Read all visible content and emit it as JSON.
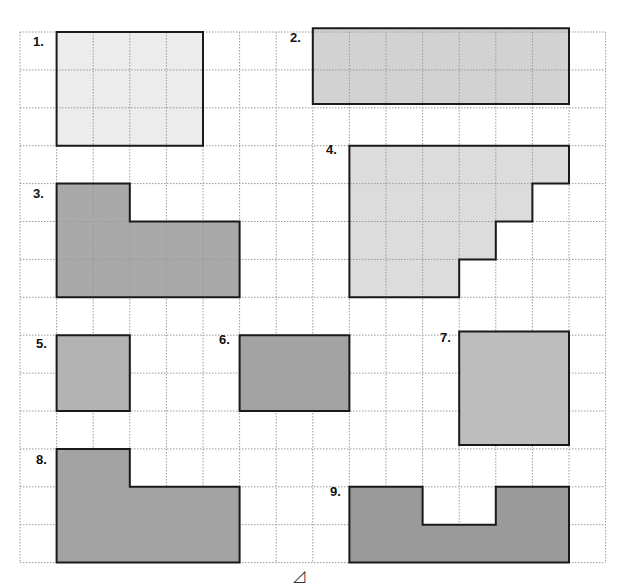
{
  "worksheet": {
    "grid": {
      "origin_x": 20,
      "origin_y": 32,
      "cell_w": 36.6,
      "cell_h": 37.9,
      "cols": 16,
      "rows": 14,
      "line_color": "#9a9a9a",
      "line_style": "dotted"
    },
    "shapes": [
      {
        "label": "1.",
        "fill": "#ececec",
        "inner_grid": true,
        "cells": [
          [
            1,
            0
          ],
          [
            2,
            0
          ],
          [
            3,
            0
          ],
          [
            4,
            0
          ],
          [
            1,
            1
          ],
          [
            2,
            1
          ],
          [
            3,
            1
          ],
          [
            4,
            1
          ],
          [
            1,
            2
          ],
          [
            2,
            2
          ],
          [
            3,
            2
          ],
          [
            4,
            2
          ]
        ],
        "outline": [
          [
            1,
            0
          ],
          [
            5,
            0
          ],
          [
            5,
            3
          ],
          [
            1,
            3
          ]
        ],
        "label_pos": [
          33,
          34
        ]
      },
      {
        "label": "2.",
        "fill": "#d2d2d2",
        "inner_grid": true,
        "cells": [
          [
            8,
            0
          ],
          [
            9,
            0
          ],
          [
            10,
            0
          ],
          [
            11,
            0
          ],
          [
            12,
            0
          ],
          [
            13,
            0
          ],
          [
            14,
            0
          ],
          [
            8,
            1
          ],
          [
            9,
            1
          ],
          [
            10,
            1
          ],
          [
            11,
            1
          ],
          [
            12,
            1
          ],
          [
            13,
            1
          ],
          [
            14,
            1
          ]
        ],
        "outline": [
          [
            8,
            -0.1
          ],
          [
            15,
            -0.1
          ],
          [
            15,
            1.9
          ],
          [
            8,
            1.9
          ]
        ],
        "label_pos": [
          290,
          30
        ]
      },
      {
        "label": "3.",
        "fill": "#a9a9a9",
        "inner_grid": true,
        "cells": [
          [
            1,
            4
          ],
          [
            2,
            4
          ],
          [
            1,
            5
          ],
          [
            2,
            5
          ],
          [
            3,
            5
          ],
          [
            4,
            5
          ],
          [
            5,
            5
          ],
          [
            1,
            6
          ],
          [
            2,
            6
          ],
          [
            3,
            6
          ],
          [
            4,
            6
          ],
          [
            5,
            6
          ]
        ],
        "outline": [
          [
            1,
            4
          ],
          [
            3,
            4
          ],
          [
            3,
            5
          ],
          [
            6,
            5
          ],
          [
            6,
            7
          ],
          [
            1,
            7
          ]
        ],
        "label_pos": [
          33,
          186
        ]
      },
      {
        "label": "4.",
        "fill": "#dcdcdc",
        "inner_grid": true,
        "cells": [
          [
            9,
            3
          ],
          [
            10,
            3
          ],
          [
            11,
            3
          ],
          [
            12,
            3
          ],
          [
            13,
            3
          ],
          [
            14,
            3
          ],
          [
            9,
            4
          ],
          [
            10,
            4
          ],
          [
            11,
            4
          ],
          [
            12,
            4
          ],
          [
            13,
            4
          ],
          [
            9,
            5
          ],
          [
            10,
            5
          ],
          [
            11,
            5
          ],
          [
            12,
            5
          ],
          [
            9,
            6
          ],
          [
            10,
            6
          ],
          [
            11,
            6
          ]
        ],
        "outline": [
          [
            9,
            3
          ],
          [
            15,
            3
          ],
          [
            15,
            4
          ],
          [
            14,
            4
          ],
          [
            14,
            5
          ],
          [
            13,
            5
          ],
          [
            13,
            6
          ],
          [
            12,
            6
          ],
          [
            12,
            7
          ],
          [
            9,
            7
          ]
        ],
        "label_pos": [
          326,
          142
        ]
      },
      {
        "label": "5.",
        "fill": "#b3b3b3",
        "inner_grid": false,
        "outline": [
          [
            1,
            8
          ],
          [
            3,
            8
          ],
          [
            3,
            10
          ],
          [
            1,
            10
          ]
        ],
        "label_pos": [
          36,
          336
        ]
      },
      {
        "label": "6.",
        "fill": "#a3a3a3",
        "inner_grid": false,
        "outline": [
          [
            6,
            8
          ],
          [
            9,
            8
          ],
          [
            9,
            10
          ],
          [
            6,
            10
          ]
        ],
        "label_pos": [
          219,
          332
        ]
      },
      {
        "label": "7.",
        "fill": "#bdbdbd",
        "inner_grid": false,
        "outline": [
          [
            12,
            7.9
          ],
          [
            15,
            7.9
          ],
          [
            15,
            10.9
          ],
          [
            12,
            10.9
          ]
        ],
        "label_pos": [
          440,
          330
        ]
      },
      {
        "label": "8.",
        "fill": "#a3a3a3",
        "inner_grid": false,
        "outline": [
          [
            1,
            11
          ],
          [
            3,
            11
          ],
          [
            3,
            12
          ],
          [
            6,
            12
          ],
          [
            6,
            14
          ],
          [
            1,
            14
          ]
        ],
        "label_pos": [
          36,
          452
        ]
      },
      {
        "label": "9.",
        "fill": "#9a9a9a",
        "inner_grid": false,
        "outline": [
          [
            9,
            12
          ],
          [
            11,
            12
          ],
          [
            11,
            13
          ],
          [
            13,
            13
          ],
          [
            13,
            12
          ],
          [
            15,
            12
          ],
          [
            15,
            14
          ],
          [
            9,
            14
          ]
        ],
        "label_pos": [
          330,
          484
        ]
      }
    ],
    "footer_mark": {
      "glyph": "◿",
      "pos": [
        293,
        566
      ]
    }
  }
}
